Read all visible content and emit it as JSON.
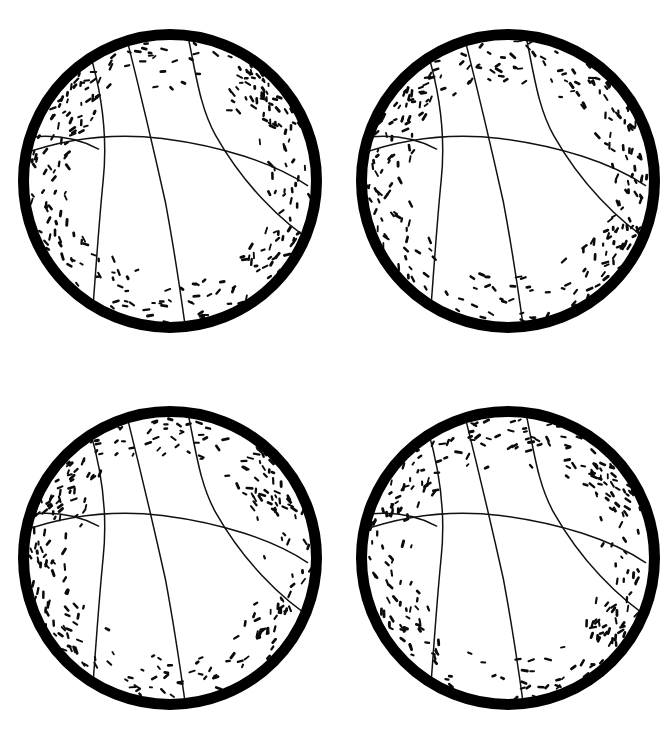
{
  "page": {
    "background_color": "#ffffff",
    "width": 672,
    "height": 740,
    "ink_color": "#000000",
    "seam_color": "#111111",
    "ball_fill_color": "#ffffff"
  },
  "grid": {
    "columns": 2,
    "rows": 2,
    "count": 4
  },
  "ball_geometry": {
    "radius": 152,
    "rim_stroke_width": 11,
    "seam_stroke_width": 1.5,
    "stipple_dash_length": 4,
    "stipple_stroke_width": 2.2
  },
  "balls": [
    {
      "id": "ball-top-left",
      "label": "Basketball 1",
      "position": "top-left",
      "cx": 170,
      "cy": 181,
      "r": 152,
      "stipple_seed": 11
    },
    {
      "id": "ball-top-right",
      "label": "Basketball 2",
      "position": "top-right",
      "cx": 508,
      "cy": 181,
      "r": 152,
      "stipple_seed": 29
    },
    {
      "id": "ball-bottom-left",
      "label": "Basketball 3",
      "position": "bottom-left",
      "cx": 170,
      "cy": 558,
      "r": 152,
      "stipple_seed": 47
    },
    {
      "id": "ball-bottom-right",
      "label": "Basketball 4",
      "position": "bottom-right",
      "cx": 508,
      "cy": 558,
      "r": 152,
      "stipple_seed": 73
    }
  ],
  "seam_paths": [
    {
      "name": "vertical-center-seam",
      "d": "M -0.29 -0.96 C -0.20 -0.60 -0.11 -0.22 -0.03 0.14 C 0.03 0.46 0.07 0.74 0.10 0.955"
    },
    {
      "name": "left-vertical-seam",
      "d": "M -0.53 -0.85 C -0.44 -0.55 -0.41 -0.28 -0.44 0.00 C -0.47 0.30 -0.49 0.62 -0.51 0.87"
    },
    {
      "name": "upper-horizontal-seam",
      "d": "M -0.99 -0.17 C -0.72 -0.27 -0.40 -0.32 -0.05 -0.28 C 0.34 -0.23 0.68 -0.12 0.905 0.03"
    },
    {
      "name": "right-curved-seam",
      "d": "M 0.11 -0.99 C 0.17 -0.72 0.19 -0.50 0.30 -0.30 C 0.47 0.00 0.72 0.27 0.985 0.43"
    },
    {
      "name": "left-lobe-seam",
      "d": "M -0.98 -0.28 C -0.80 -0.31 -0.62 -0.29 -0.47 -0.21"
    }
  ],
  "stipple_zones": [
    {
      "name": "top-band",
      "angle_start": 200,
      "angle_end": 340,
      "count": 80
    },
    {
      "name": "left-band",
      "angle_start": 140,
      "angle_end": 230,
      "count": 55
    },
    {
      "name": "right-band",
      "angle_start": -55,
      "angle_end": 45,
      "count": 58
    },
    {
      "name": "bottom-band",
      "angle_start": 20,
      "angle_end": 160,
      "count": 70
    }
  ]
}
